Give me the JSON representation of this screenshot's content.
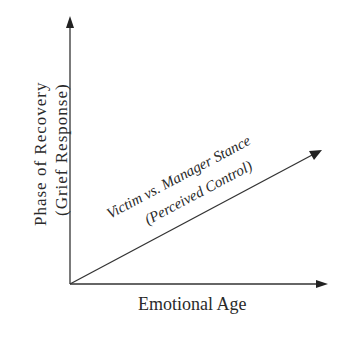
{
  "diagram": {
    "y_axis": {
      "label_line1": "Phase of Recovery",
      "label_line2": "(Grief Response)"
    },
    "x_axis": {
      "label": "Emotional Age"
    },
    "diagonal": {
      "label_line1": "Victim vs. Manager Stance",
      "label_line2": "(Perceived Control)"
    },
    "colors": {
      "line": "#333333",
      "text": "#2a2a2a",
      "background": "#ffffff"
    }
  }
}
